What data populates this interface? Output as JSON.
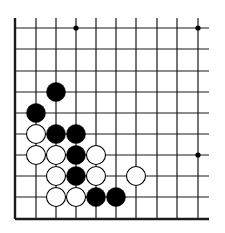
{
  "board": {
    "description": "Go board corner fragment (lower-left), 10 columns x 10 rows visible",
    "colors": {
      "background": "#ffffff",
      "line": "#1a1a1a",
      "black_stone": "#000000",
      "white_stone": "#ffffff",
      "star_point": "#000000"
    },
    "columns_x": [
      15,
      36,
      56,
      76,
      96,
      116,
      136,
      157,
      177,
      198
    ],
    "rows_y": [
      28,
      49,
      71,
      92,
      113,
      134,
      155,
      176,
      197,
      219
    ],
    "line_extent": {
      "left": 15,
      "right": 209,
      "top": 18,
      "bottom": 219
    },
    "edges": [
      "left",
      "bottom"
    ],
    "star_points": [
      {
        "col": 3,
        "row": 0
      },
      {
        "col": 9,
        "row": 0
      },
      {
        "col": 9,
        "row": 6
      }
    ],
    "stones": [
      {
        "color": "black",
        "col": 2,
        "row": 3
      },
      {
        "color": "black",
        "col": 1,
        "row": 4
      },
      {
        "color": "white",
        "col": 1,
        "row": 5
      },
      {
        "color": "black",
        "col": 2,
        "row": 5
      },
      {
        "color": "black",
        "col": 3,
        "row": 5
      },
      {
        "color": "white",
        "col": 1,
        "row": 6
      },
      {
        "color": "white",
        "col": 2,
        "row": 6
      },
      {
        "color": "black",
        "col": 3,
        "row": 6
      },
      {
        "color": "white",
        "col": 4,
        "row": 6
      },
      {
        "color": "white",
        "col": 2,
        "row": 7
      },
      {
        "color": "black",
        "col": 3,
        "row": 7
      },
      {
        "color": "white",
        "col": 4,
        "row": 7
      },
      {
        "color": "white",
        "col": 6,
        "row": 7
      },
      {
        "color": "white",
        "col": 2,
        "row": 8
      },
      {
        "color": "white",
        "col": 3,
        "row": 8
      },
      {
        "color": "black",
        "col": 4,
        "row": 8
      },
      {
        "color": "black",
        "col": 5,
        "row": 8
      }
    ],
    "stone_radius": 9.5
  }
}
